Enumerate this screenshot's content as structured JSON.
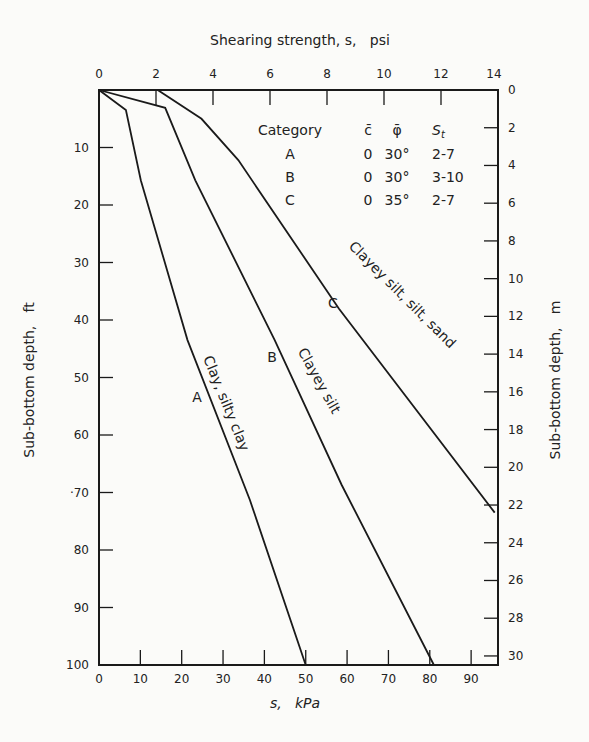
{
  "chart_data": {
    "type": "line",
    "title": "",
    "top_axis": {
      "label": "Shearing strength, s,   psi",
      "ticks": [
        0,
        2,
        4,
        6,
        8,
        10,
        12,
        14
      ],
      "range": [
        0,
        14
      ]
    },
    "bottom_axis": {
      "label": "s,   kPa",
      "ticks": [
        0,
        10,
        20,
        30,
        40,
        50,
        60,
        70,
        80,
        90
      ],
      "range": [
        0,
        96.5
      ]
    },
    "left_axis": {
      "label": "Sub-bottom depth,   ft",
      "ticks": [
        0,
        10,
        20,
        30,
        40,
        50,
        60,
        70,
        80,
        90,
        100
      ],
      "tick_labels": [
        "",
        "10",
        "20",
        "30",
        "40",
        "50",
        "60",
        "·70",
        "80",
        "9̇0",
        "100"
      ],
      "range": [
        0,
        100
      ],
      "inverted": true
    },
    "right_axis": {
      "label": "Sub-bottom depth,   m",
      "ticks": [
        0,
        2,
        4,
        6,
        8,
        10,
        12,
        14,
        16,
        18,
        20,
        22,
        24,
        26,
        28,
        30
      ],
      "range": [
        0,
        30.48
      ],
      "inverted": true
    },
    "series": [
      {
        "name": "A",
        "description": "Clay, silty clay",
        "points": [
          [
            0,
            0
          ],
          [
            6.5,
            3.5
          ],
          [
            10.1,
            15.7
          ],
          [
            21.4,
            43.5
          ],
          [
            36.5,
            71.3
          ],
          [
            50,
            100
          ]
        ]
      },
      {
        "name": "B",
        "description": "Clayey silt",
        "points": [
          [
            0,
            0
          ],
          [
            16,
            3.1
          ],
          [
            23.3,
            15.7
          ],
          [
            42.5,
            43.5
          ],
          [
            58.7,
            68.7
          ],
          [
            81,
            100
          ]
        ]
      },
      {
        "name": "C",
        "description": "Clayey silt, silt, sand",
        "points": [
          [
            14.2,
            0
          ],
          [
            24.8,
            5
          ],
          [
            33.7,
            12.2
          ],
          [
            58,
            38
          ],
          [
            95.7,
            73.5
          ]
        ]
      }
    ],
    "legend": {
      "headers": [
        "Category",
        "c̄",
        "φ̄",
        "St"
      ],
      "rows": [
        [
          "A",
          "0",
          "30°",
          "2-7"
        ],
        [
          "B",
          "0",
          "30°",
          "3-10"
        ],
        [
          "C",
          "0",
          "35°",
          "2-7"
        ]
      ]
    },
    "grid": false,
    "legend_position": "top-right inside"
  }
}
